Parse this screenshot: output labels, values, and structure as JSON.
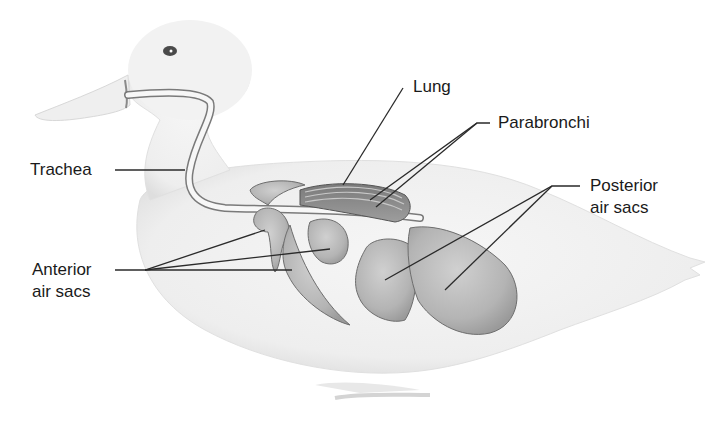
{
  "diagram": {
    "labels": {
      "trachea": "Trachea",
      "lung": "Lung",
      "parabronchi": "Parabronchi",
      "posterior_line1": "Posterior",
      "posterior_line2": "air sacs",
      "anterior_line1": "Anterior",
      "anterior_line2": "air sacs"
    },
    "colors": {
      "body_fill": "#f1f1f1",
      "body_edge": "#d6d6d6",
      "organ_fill": "#b9b9b9",
      "organ_edge": "#6e6e6e",
      "lung_fill": "#8f8f8f",
      "trachea_fill": "#f7f7f7",
      "leader_line": "#2a2a2a",
      "text": "#1a1a1a"
    }
  }
}
